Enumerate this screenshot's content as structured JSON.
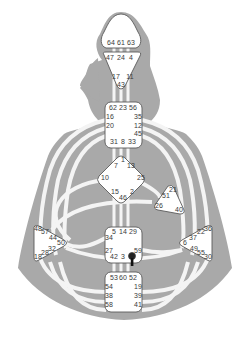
{
  "colors": {
    "background": "#ffffff",
    "silhouette": "#a9a9a9",
    "channel": "#f4f4f4",
    "center_fill": "#ffffff",
    "center_stroke": "#5a5a5a",
    "gate_text": "#3a3a3a",
    "marker": "#222222"
  },
  "centers": {
    "head": {
      "name": "Head",
      "gates": [
        "64",
        "61",
        "63"
      ]
    },
    "ajna": {
      "name": "Ajna",
      "gates": [
        "47",
        "24",
        "4",
        "17",
        "11",
        "43"
      ]
    },
    "throat": {
      "name": "Throat",
      "gates": [
        "62",
        "23",
        "56",
        "16",
        "35",
        "20",
        "12",
        "45",
        "31",
        "8",
        "33"
      ]
    },
    "g": {
      "name": "G Center",
      "gates": [
        "1",
        "7",
        "13",
        "10",
        "25",
        "15",
        "2",
        "46"
      ]
    },
    "ego": {
      "name": "Heart/Ego",
      "gates": [
        "21",
        "51",
        "26",
        "40"
      ]
    },
    "spleen": {
      "name": "Spleen",
      "gates": [
        "48",
        "57",
        "44",
        "50",
        "32",
        "28",
        "18"
      ]
    },
    "sacral": {
      "name": "Sacral",
      "gates": [
        "5",
        "14",
        "29",
        "34",
        "27",
        "59",
        "42",
        "3",
        "9"
      ]
    },
    "solar": {
      "name": "Solar Plexus",
      "gates": [
        "36",
        "22",
        "37",
        "6",
        "49",
        "55",
        "30"
      ]
    },
    "root": {
      "name": "Root",
      "gates": [
        "53",
        "60",
        "52",
        "54",
        "19",
        "38",
        "39",
        "58",
        "41"
      ]
    }
  },
  "marker": {
    "icon": "pin-marker-icon",
    "near_gate": "9"
  }
}
